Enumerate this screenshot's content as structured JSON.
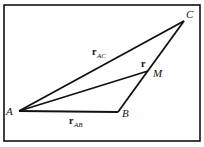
{
  "diagram": {
    "type": "vector-triangle",
    "points": {
      "A": {
        "label": "A",
        "x": 19,
        "y": 111
      },
      "B": {
        "label": "B",
        "x": 118,
        "y": 112
      },
      "C": {
        "label": "C",
        "x": 184,
        "y": 21
      },
      "M": {
        "label": "M",
        "x": 148,
        "y": 71
      }
    },
    "vectors": {
      "r_AC": {
        "main": "r",
        "sub": "AC"
      },
      "r_AB": {
        "main": "r",
        "sub": "AB"
      },
      "r": {
        "main": "r"
      }
    },
    "colors": {
      "line": "#111111",
      "background": "#ffffff"
    }
  }
}
